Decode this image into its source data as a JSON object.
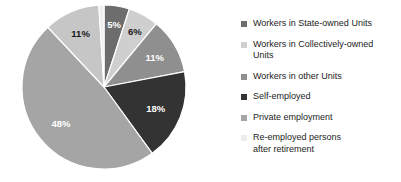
{
  "chart_data": {
    "type": "pie",
    "title": "",
    "start_angle_deg": 0,
    "direction": "clockwise",
    "legend_position": "right",
    "grid": false,
    "categories": [
      "Workers in State-owned Units",
      "Workers in Collectively-owned Units",
      "Workers in other Units",
      "Self-employed",
      "Private employment",
      "Re-employed persons after retirement"
    ],
    "slices": [
      {
        "label": "5%",
        "value": 5,
        "category": "Workers in State-owned Units",
        "color": "#6d6d6d",
        "label_color": "light"
      },
      {
        "label": "6%",
        "value": 6,
        "category": "Workers in Collectively-owned Units",
        "color": "#cfcfcf",
        "label_color": "dark"
      },
      {
        "label": "11%",
        "value": 11,
        "category": "Workers in other Units",
        "color": "#8f8f8f",
        "label_color": "light"
      },
      {
        "label": "18%",
        "value": 18,
        "category": "Self-employed",
        "color": "#333333",
        "label_color": "light"
      },
      {
        "label": "48%",
        "value": 48,
        "category": "Private employment",
        "color": "#a5a5a5",
        "label_color": "light"
      },
      {
        "label": "11%",
        "value": 11,
        "category": "Workers in Collectively-owned Units",
        "color": "#c6c6c6",
        "label_color": "dark"
      },
      {
        "label": "1%",
        "value": 1,
        "category": "Re-employed persons after retirement",
        "color": "#ededed",
        "label_color": "dark"
      }
    ],
    "total": 100
  },
  "legend": {
    "items": [
      {
        "label": "Workers in State-owned Units",
        "color": "#6d6d6d"
      },
      {
        "label": "Workers in Collectively-owned\nUnits",
        "color": "#cfcfcf"
      },
      {
        "label": "Workers in other Units",
        "color": "#8f8f8f"
      },
      {
        "label": "Self-employed",
        "color": "#333333"
      },
      {
        "label": "Private employment",
        "color": "#a5a5a5"
      },
      {
        "label": "Re-employed persons\nafter retirement",
        "color": "#ededed"
      }
    ]
  },
  "style": {
    "background": "#ffffff",
    "slice_border": "#ffffff",
    "text_color": "#1c1c1c"
  }
}
